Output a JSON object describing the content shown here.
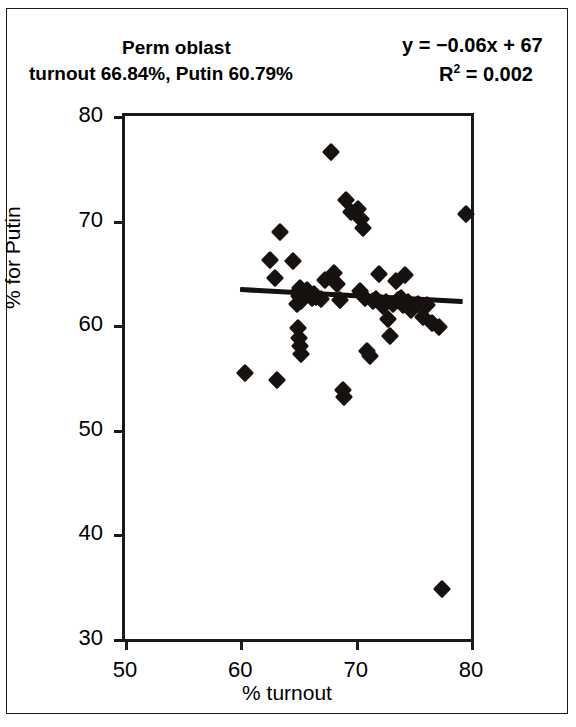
{
  "header": {
    "title_line1": "Perm oblast",
    "title_line2": "turnout 66.84%, Putin 60.79%",
    "equation": "y = −0.06x + 67",
    "r_squared_prefix": "R",
    "r_squared_exp": "2",
    "r_squared_value": " = 0.002"
  },
  "chart_data": {
    "type": "scatter",
    "title": "Perm oblast",
    "subtitle": "turnout 66.84%, Putin 60.79%",
    "xlabel": "% turnout",
    "ylabel": "% for Putin",
    "xlim": [
      50,
      80
    ],
    "ylim": [
      30,
      80
    ],
    "xticks": [
      50,
      60,
      70,
      80
    ],
    "yticks": [
      30,
      40,
      50,
      60,
      70,
      80
    ],
    "grid": false,
    "legend": null,
    "annotations": [
      "y = −0.06x + 67",
      "R² = 0.002"
    ],
    "trendline": {
      "type": "linear",
      "slope": -0.06,
      "intercept": 67,
      "r_squared": 0.002,
      "x_start": 60.0,
      "x_end": 79.3,
      "y_start": 63.4,
      "y_end": 62.24
    },
    "region_summary": {
      "region": "Perm oblast",
      "turnout_percent": 66.84,
      "putin_percent": 60.79
    },
    "series": [
      {
        "name": "polling districts",
        "marker": "diamond",
        "color": "#17120f",
        "points": [
          [
            60.4,
            55.4
          ],
          [
            62.6,
            66.2
          ],
          [
            63.0,
            64.5
          ],
          [
            63.4,
            68.9
          ],
          [
            63.2,
            54.8
          ],
          [
            64.6,
            66.1
          ],
          [
            65.0,
            63.2
          ],
          [
            65.2,
            63.6
          ],
          [
            65.1,
            62.8
          ],
          [
            65.3,
            62.3
          ],
          [
            65.0,
            59.7
          ],
          [
            65.1,
            58.8
          ],
          [
            65.2,
            58.0
          ],
          [
            65.3,
            57.2
          ],
          [
            64.9,
            62.0
          ],
          [
            65.6,
            63.1
          ],
          [
            65.8,
            63.4
          ],
          [
            66.0,
            62.9
          ],
          [
            66.2,
            62.6
          ],
          [
            66.4,
            63.0
          ],
          [
            66.6,
            62.7
          ],
          [
            67.0,
            62.5
          ],
          [
            67.3,
            64.3
          ],
          [
            67.9,
            76.6
          ],
          [
            68.1,
            65.0
          ],
          [
            68.4,
            63.9
          ],
          [
            68.6,
            62.4
          ],
          [
            68.9,
            53.8
          ],
          [
            69.0,
            53.1
          ],
          [
            69.2,
            72.0
          ],
          [
            69.6,
            70.8
          ],
          [
            70.2,
            71.1
          ],
          [
            70.5,
            70.2
          ],
          [
            70.6,
            69.3
          ],
          [
            70.4,
            63.3
          ],
          [
            70.8,
            62.6
          ],
          [
            71.0,
            57.5
          ],
          [
            71.2,
            57.1
          ],
          [
            71.5,
            62.3
          ],
          [
            71.8,
            62.5
          ],
          [
            72.0,
            64.9
          ],
          [
            72.2,
            62.1
          ],
          [
            72.4,
            61.8
          ],
          [
            72.6,
            62.2
          ],
          [
            72.8,
            60.6
          ],
          [
            73.0,
            59.0
          ],
          [
            73.2,
            62.0
          ],
          [
            73.5,
            64.2
          ],
          [
            73.7,
            62.4
          ],
          [
            73.9,
            62.6
          ],
          [
            74.1,
            61.9
          ],
          [
            74.3,
            64.8
          ],
          [
            74.5,
            62.2
          ],
          [
            74.8,
            61.5
          ],
          [
            75.0,
            61.8
          ],
          [
            75.4,
            62.0
          ],
          [
            75.8,
            60.8
          ],
          [
            76.2,
            61.9
          ],
          [
            76.6,
            60.2
          ],
          [
            77.2,
            59.8
          ],
          [
            77.5,
            34.8
          ],
          [
            79.6,
            70.6
          ]
        ]
      }
    ]
  },
  "axes": {
    "y_tick_labels": [
      "80",
      "70",
      "60",
      "50",
      "40",
      "30"
    ],
    "x_tick_labels": [
      "50",
      "60",
      "70",
      "80"
    ],
    "x_axis_title": "% turnout",
    "y_axis_title": "% for Putin"
  }
}
